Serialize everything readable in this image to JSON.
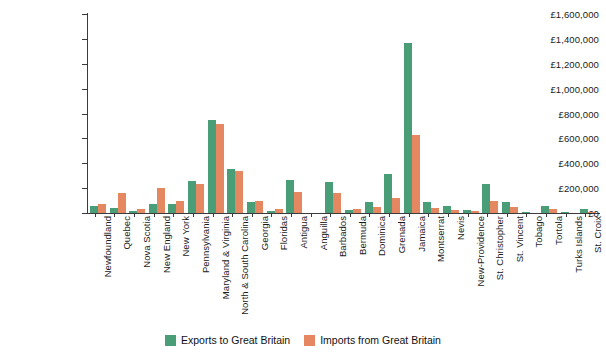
{
  "chart_data": {
    "type": "bar",
    "title": "",
    "xlabel": "",
    "ylabel": "",
    "ylim": [
      0,
      1600000
    ],
    "grid": false,
    "legend_position": "bottom-center",
    "y_ticks": [
      "£0",
      "£200,000",
      "£400,000",
      "£600,000",
      "£800,000",
      "£1,000,000",
      "£1,200,000",
      "£1,400,000",
      "£1,600,000"
    ],
    "y_tick_values": [
      0,
      200000,
      400000,
      600000,
      800000,
      1000000,
      1200000,
      1400000,
      1600000
    ],
    "currency_symbol": "£",
    "categories": [
      "Newfoundland",
      "Quebec",
      "Nova Scotia",
      "New England",
      "New York",
      "Pennsylvania",
      "Maryland & Virginia",
      "North & South Carolina",
      "Georgia",
      "Floridas",
      "Antigua",
      "Anguilla",
      "Barbados",
      "Bermuda",
      "Dominica",
      "Grenada",
      "Jamaica",
      "Montserrat",
      "Nevis",
      "New-Providence",
      "St. Christopher",
      "St. Vincent",
      "Tobago",
      "Tortola",
      "Turks Islands",
      "St. Croix"
    ],
    "series": [
      {
        "name": "Exports to Great Britain",
        "color": "#4a9e77",
        "values": [
          55000,
          40000,
          20000,
          75000,
          75000,
          260000,
          745000,
          350000,
          85000,
          15000,
          265000,
          0,
          250000,
          25000,
          90000,
          315000,
          1370000,
          85000,
          55000,
          25000,
          230000,
          90000,
          5000,
          60000,
          5000,
          35000
        ]
      },
      {
        "name": "Imports from Great Britain",
        "color": "#e58761",
        "values": [
          75000,
          160000,
          30000,
          205000,
          95000,
          230000,
          715000,
          335000,
          95000,
          35000,
          165000,
          0,
          160000,
          30000,
          45000,
          120000,
          625000,
          40000,
          25000,
          15000,
          95000,
          45000,
          0,
          35000,
          0,
          5000
        ]
      }
    ]
  },
  "legend": {
    "items": [
      {
        "label": "Exports to Great Britain",
        "color": "#4a9e77"
      },
      {
        "label": "Imports from Great Britain",
        "color": "#e58761"
      }
    ]
  }
}
